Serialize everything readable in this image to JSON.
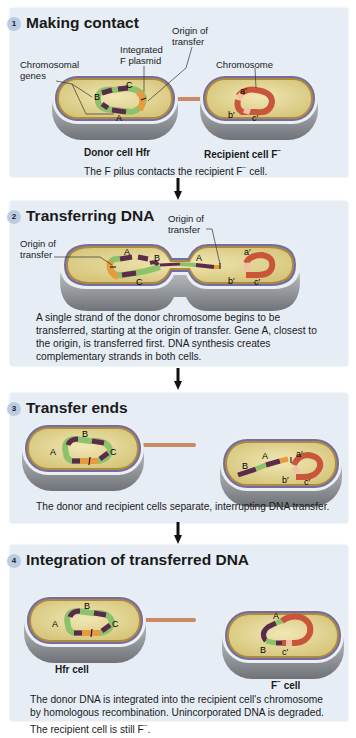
{
  "figure": {
    "colors": {
      "panel_bg": "#e6edf5",
      "step_circle": "#b9cce3",
      "cytoplasm": "#e4d79a",
      "membrane_outer": "#6e6fa8",
      "wall_gray": "#8c8e92",
      "donor_dna_dark": "#5a2b4a",
      "donor_dna_green": "#8dc26a",
      "f_plasmid_orange": "#e89a3c",
      "recipient_dna_red": "#c9553a",
      "pilus": "#c98a64"
    },
    "steps": [
      {
        "number": "1",
        "title": "Making contact",
        "labels": {
          "chromosomal_genes_1": "Chromosomal",
          "chromosomal_genes_2": "genes",
          "integrated_f_1": "Integrated",
          "integrated_f_2": "F plasmid",
          "origin_1": "Origin of",
          "origin_2": "transfer",
          "chromosome": "Chromosome"
        },
        "genes": [
          "A",
          "B",
          "C",
          "a′",
          "b′",
          "c′"
        ],
        "cell_labels": {
          "donor": "Donor cell Hfr",
          "recipient": "Recipient cell F",
          "recipient_sup": "−"
        },
        "caption_pre": "The F pilus contacts the recipient F",
        "caption_sup": "−",
        "caption_post": " cell."
      },
      {
        "number": "2",
        "title": "Transferring DNA",
        "labels": {
          "origin_left_1": "Origin of",
          "origin_left_2": "transfer",
          "origin_right_1": "Origin of",
          "origin_right_2": "transfer"
        },
        "genes": [
          "A",
          "B",
          "C",
          "A",
          "a′",
          "b′",
          "c′"
        ],
        "caption": "A single strand of the donor chromosome begins to be transferred, starting at the origin of transfer. Gene A, closest to the origin, is transferred first. DNA synthesis creates complementary strands in both cells."
      },
      {
        "number": "3",
        "title": "Transfer ends",
        "genes": [
          "A",
          "B",
          "C",
          "B",
          "A",
          "a′",
          "b′",
          "c′"
        ],
        "caption": "The donor and recipient cells separate, interrupting DNA transfer."
      },
      {
        "number": "4",
        "title": "Integration of transferred DNA",
        "genes": [
          "A",
          "B",
          "C",
          "A",
          "B",
          "c′"
        ],
        "cell_labels": {
          "donor": "Hfr cell",
          "recipient_pre": "F",
          "recipient_sup": "−",
          "recipient_post": " cell"
        },
        "caption_pre": "The donor DNA is integrated into the recipient cell's chromosome by homologous recombination. Unincorporated DNA is degraded. The recipient cell is still F",
        "caption_sup": "−",
        "caption_post": "."
      }
    ]
  }
}
